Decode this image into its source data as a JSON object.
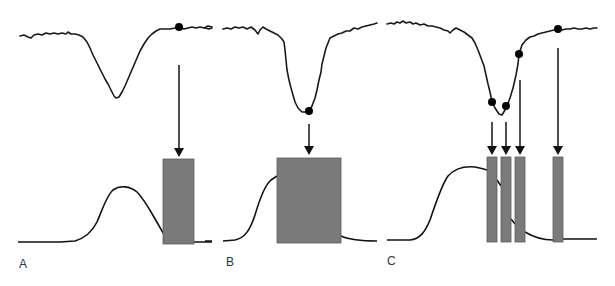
{
  "figure": {
    "panels": [
      {
        "id": "A",
        "label": "A",
        "description": "Single shock delivered at return to baseline after pressure dip; bar falls after hump of lower curve",
        "top_trace": {
          "baseline_y": 32,
          "dip_center_x": 118,
          "dip_min_y": 98,
          "x_start": 20,
          "x_end": 212
        },
        "markers": [
          {
            "x": 179,
            "y": 27
          }
        ],
        "arrows": [
          {
            "x": 179,
            "y1": 65,
            "y2": 155
          }
        ],
        "bars": [
          {
            "x": 163,
            "y": 159,
            "w": 31,
            "h": 85
          }
        ],
        "lower_curve": {
          "x_start": 18,
          "x_end": 212,
          "baseline_y": 242,
          "peak_x": 124,
          "peak_y": 188
        }
      },
      {
        "id": "B",
        "label": "B",
        "description": "Single large shock at trough of pressure dip",
        "top_trace": {
          "baseline_y": 29,
          "dip_center_x": 308,
          "dip_min_y": 113,
          "x_start": 205,
          "x_end": 377
        },
        "markers": [
          {
            "x": 309,
            "y": 111
          }
        ],
        "arrows": [
          {
            "x": 309,
            "y1": 124,
            "y2": 153
          }
        ],
        "bars": [
          {
            "x": 277,
            "y": 158,
            "w": 64,
            "h": 85
          }
        ],
        "lower_curve": {
          "x_start": 205,
          "x_end": 377,
          "baseline_y": 241,
          "peak_x": 277,
          "peak_y": 177
        }
      },
      {
        "id": "C",
        "label": "C",
        "description": "Multiple narrow shocks at successive points of the pressure dip",
        "top_trace": {
          "baseline_y": 25,
          "dip_center_x": 500,
          "dip_min_y": 116,
          "x_start": 387,
          "x_end": 597
        },
        "markers": [
          {
            "x": 492,
            "y": 102
          },
          {
            "x": 506,
            "y": 106
          },
          {
            "x": 519,
            "y": 54
          },
          {
            "x": 558,
            "y": 29
          }
        ],
        "arrows": [
          {
            "x": 492,
            "y1": 122,
            "y2": 153
          },
          {
            "x": 506,
            "y1": 122,
            "y2": 153
          },
          {
            "x": 520,
            "y1": 80,
            "y2": 153
          },
          {
            "x": 558,
            "y1": 48,
            "y2": 153
          }
        ],
        "bars": [
          {
            "x": 487,
            "y": 157,
            "w": 10,
            "h": 85
          },
          {
            "x": 501,
            "y": 157,
            "w": 10,
            "h": 85
          },
          {
            "x": 515,
            "y": 157,
            "w": 10,
            "h": 85
          },
          {
            "x": 553,
            "y": 157,
            "w": 10,
            "h": 85
          }
        ],
        "lower_curve": {
          "x_start": 387,
          "x_end": 597,
          "baseline_y": 240,
          "peak_x": 472,
          "peak_y": 167
        }
      }
    ],
    "colors": {
      "trace": "#1a1a1a",
      "bar": "#7a7a7a",
      "marker": "#000000",
      "label": "#333333"
    }
  }
}
